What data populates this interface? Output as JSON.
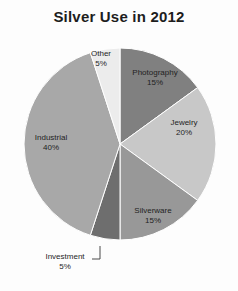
{
  "chart": {
    "title": "Silver Use in 2012"
  },
  "chart_data": {
    "type": "pie",
    "title": "Silver Use in 2012",
    "xlabel": "",
    "ylabel": "",
    "legend": "none",
    "grid": false,
    "start_angle_deg": 0,
    "direction": "clockwise",
    "units": "percent",
    "total": 100,
    "categories": [
      "Photography",
      "Jewelry",
      "Silverware",
      "Investment",
      "Industrial",
      "Other"
    ],
    "values": [
      15,
      20,
      15,
      5,
      40,
      5
    ],
    "colors": [
      "#808080",
      "#c8c8c8",
      "#989898",
      "#6e6e6e",
      "#a8a8a8",
      "#ececec"
    ],
    "slices": [
      {
        "label": "Photography",
        "value": 15,
        "value_text": "15%",
        "color": "#808080",
        "label_position": "inside"
      },
      {
        "label": "Jewelry",
        "value": 20,
        "value_text": "20%",
        "color": "#c8c8c8",
        "label_position": "inside"
      },
      {
        "label": "Silverware",
        "value": 15,
        "value_text": "15%",
        "color": "#989898",
        "label_position": "inside"
      },
      {
        "label": "Investment",
        "value": 5,
        "value_text": "5%",
        "color": "#6e6e6e",
        "label_position": "outside"
      },
      {
        "label": "Industrial",
        "value": 40,
        "value_text": "40%",
        "color": "#a8a8a8",
        "label_position": "inside"
      },
      {
        "label": "Other",
        "value": 5,
        "value_text": "5%",
        "color": "#ececec",
        "label_position": "inside"
      }
    ]
  },
  "labels": {
    "photography": {
      "name": "Photography",
      "value": "15%"
    },
    "jewelry": {
      "name": "Jewelry",
      "value": "20%"
    },
    "silverware": {
      "name": "Silverware",
      "value": "15%"
    },
    "investment": {
      "name": "Investment",
      "value": "5%"
    },
    "industrial": {
      "name": "Industrial",
      "value": "40%"
    },
    "other": {
      "name": "Other",
      "value": "5%"
    }
  },
  "style": {
    "background": "#fdfdfd",
    "title_color": "#1d1d1d",
    "label_color": "#1f1f1f",
    "leader_color": "#4a4a4a"
  }
}
